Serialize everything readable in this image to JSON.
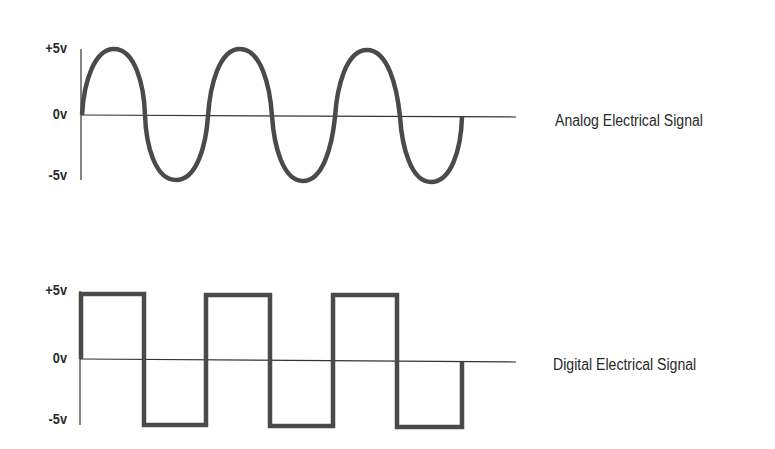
{
  "diagrams": [
    {
      "id": "analog",
      "title": "Analog Electrical Signal",
      "y_labels": {
        "top": "+5v",
        "mid": "0v",
        "bottom": "-5v"
      },
      "waveform": "sine",
      "cycles": 3,
      "color": "#4a4a4a"
    },
    {
      "id": "digital",
      "title": "Digital Electrical Signal",
      "y_labels": {
        "top": "+5v",
        "mid": "0v",
        "bottom": "-5v"
      },
      "waveform": "square",
      "cycles": 3,
      "color": "#4a4a4a"
    }
  ]
}
